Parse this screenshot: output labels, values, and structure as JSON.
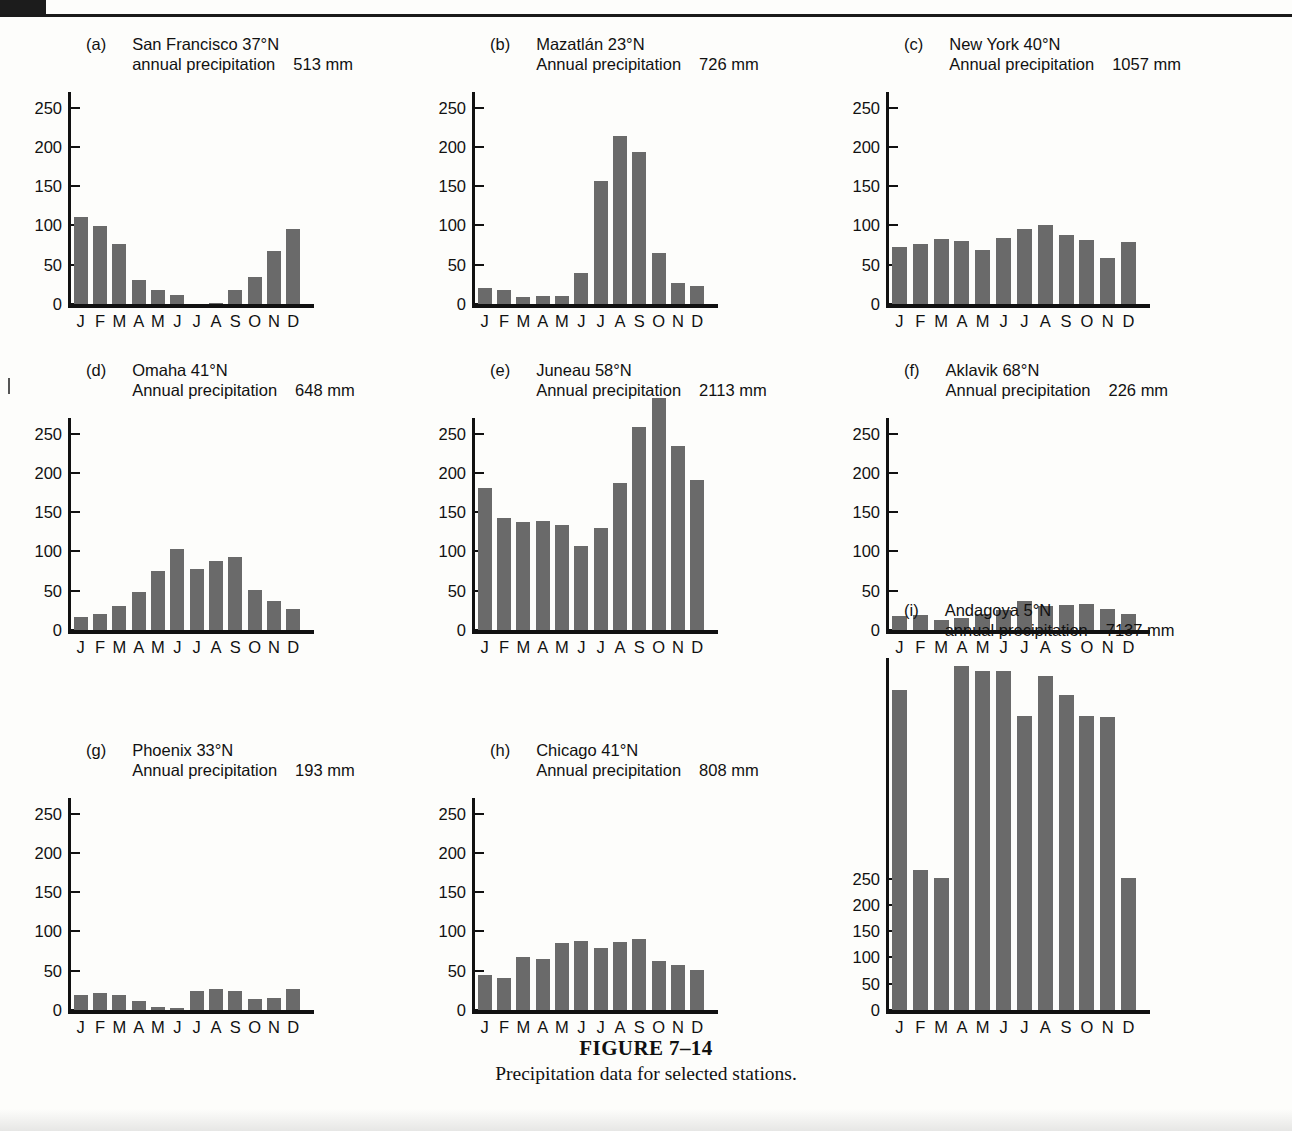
{
  "figure": {
    "caption_title": "FIGURE 7–14",
    "caption_subtitle": "Precipitation data for selected stations.",
    "months": [
      "J",
      "F",
      "M",
      "A",
      "M",
      "J",
      "J",
      "A",
      "S",
      "O",
      "N",
      "D"
    ],
    "y_ticks": [
      0,
      50,
      100,
      150,
      200,
      250
    ],
    "units": "mm",
    "bar_color": "#6a6a6a",
    "axis_color": "#111111"
  },
  "chart_data": [
    {
      "type": "bar",
      "panel": "a",
      "station": "San Francisco 37°N",
      "precip_label": "annual precipitation",
      "precip_value": "513 mm",
      "annual_total": 513,
      "title": "San Francisco 37°N annual precipitation 513 mm",
      "xlabel": "",
      "ylabel": "",
      "grid": false,
      "ylim": [
        0,
        270
      ],
      "yticks": [
        0,
        50,
        100,
        150,
        200,
        250
      ],
      "categories": [
        "J",
        "F",
        "M",
        "A",
        "M",
        "J",
        "J",
        "A",
        "S",
        "O",
        "N",
        "D"
      ],
      "values": [
        111,
        99,
        77,
        30,
        18,
        11,
        0,
        1,
        18,
        35,
        68,
        96
      ]
    },
    {
      "type": "bar",
      "panel": "b",
      "station": "Mazatlán 23°N",
      "precip_label": "Annual precipitation",
      "precip_value": "726 mm",
      "annual_total": 726,
      "title": "Mazatlán 23°N Annual precipitation 726 mm",
      "xlabel": "",
      "ylabel": "",
      "grid": false,
      "ylim": [
        0,
        270
      ],
      "yticks": [
        0,
        50,
        100,
        150,
        200,
        250
      ],
      "categories": [
        "J",
        "F",
        "M",
        "A",
        "M",
        "J",
        "J",
        "A",
        "S",
        "O",
        "N",
        "D"
      ],
      "values": [
        21,
        18,
        9,
        10,
        10,
        39,
        157,
        214,
        194,
        65,
        27,
        23
      ]
    },
    {
      "type": "bar",
      "panel": "c",
      "station": "New York 40°N",
      "precip_label": "Annual precipitation",
      "precip_value": "1057 mm",
      "annual_total": 1057,
      "title": "New York 40°N Annual precipitation 1057 mm",
      "xlabel": "",
      "ylabel": "",
      "grid": false,
      "ylim": [
        0,
        270
      ],
      "yticks": [
        0,
        50,
        100,
        150,
        200,
        250
      ],
      "categories": [
        "J",
        "F",
        "M",
        "A",
        "M",
        "J",
        "J",
        "A",
        "S",
        "O",
        "N",
        "D"
      ],
      "values": [
        72,
        77,
        83,
        80,
        69,
        84,
        96,
        100,
        88,
        81,
        58,
        79
      ]
    },
    {
      "type": "bar",
      "panel": "d",
      "station": "Omaha 41°N",
      "precip_label": "Annual precipitation",
      "precip_value": "648 mm",
      "annual_total": 648,
      "title": "Omaha 41°N Annual precipitation 648 mm",
      "xlabel": "",
      "ylabel": "",
      "grid": false,
      "ylim": [
        0,
        270
      ],
      "yticks": [
        0,
        50,
        100,
        150,
        200,
        250
      ],
      "categories": [
        "J",
        "F",
        "M",
        "A",
        "M",
        "J",
        "J",
        "A",
        "S",
        "O",
        "N",
        "D"
      ],
      "values": [
        17,
        21,
        30,
        48,
        75,
        103,
        78,
        88,
        93,
        51,
        37,
        27
      ]
    },
    {
      "type": "bar",
      "panel": "e",
      "station": "Juneau 58°N",
      "precip_label": "Annual precipitation",
      "precip_value": "2113 mm",
      "annual_total": 2113,
      "title": "Juneau 58°N Annual precipitation 2113 mm",
      "xlabel": "",
      "ylabel": "",
      "grid": false,
      "ylim": [
        0,
        270
      ],
      "yticks": [
        0,
        50,
        100,
        150,
        200,
        250
      ],
      "categories": [
        "J",
        "F",
        "M",
        "A",
        "M",
        "J",
        "J",
        "A",
        "S",
        "O",
        "N",
        "D"
      ],
      "values": [
        181,
        143,
        138,
        139,
        134,
        107,
        130,
        187,
        258,
        295,
        234,
        191
      ]
    },
    {
      "type": "bar",
      "panel": "f",
      "station": "Aklavik 68°N",
      "precip_label": "Annual precipitation",
      "precip_value": "226 mm",
      "annual_total": 226,
      "title": "Aklavik 68°N Annual precipitation 226 mm",
      "xlabel": "",
      "ylabel": "",
      "grid": false,
      "ylim": [
        0,
        270
      ],
      "yticks": [
        0,
        50,
        100,
        150,
        200,
        250
      ],
      "categories": [
        "J",
        "F",
        "M",
        "A",
        "M",
        "J",
        "J",
        "A",
        "S",
        "O",
        "N",
        "D"
      ],
      "values": [
        18,
        19,
        13,
        15,
        20,
        25,
        37,
        31,
        32,
        33,
        27,
        21
      ]
    },
    {
      "type": "bar",
      "panel": "g",
      "station": "Phoenix 33°N",
      "precip_label": "Annual precipitation",
      "precip_value": "193 mm",
      "annual_total": 193,
      "title": "Phoenix 33°N Annual precipitation 193 mm",
      "xlabel": "",
      "ylabel": "",
      "grid": false,
      "ylim": [
        0,
        270
      ],
      "yticks": [
        0,
        50,
        100,
        150,
        200,
        250
      ],
      "categories": [
        "J",
        "F",
        "M",
        "A",
        "M",
        "J",
        "J",
        "A",
        "S",
        "O",
        "N",
        "D"
      ],
      "values": [
        19,
        22,
        19,
        12,
        4,
        3,
        24,
        27,
        24,
        14,
        15,
        27
      ]
    },
    {
      "type": "bar",
      "panel": "h",
      "station": "Chicago 41°N",
      "precip_label": "Annual precipitation",
      "precip_value": "808 mm",
      "annual_total": 808,
      "title": "Chicago 41°N Annual precipitation 808 mm",
      "xlabel": "",
      "ylabel": "",
      "grid": false,
      "ylim": [
        0,
        270
      ],
      "yticks": [
        0,
        50,
        100,
        150,
        200,
        250
      ],
      "categories": [
        "J",
        "F",
        "M",
        "A",
        "M",
        "J",
        "J",
        "A",
        "S",
        "O",
        "N",
        "D"
      ],
      "values": [
        45,
        41,
        68,
        65,
        85,
        88,
        79,
        86,
        91,
        63,
        57,
        51
      ]
    },
    {
      "type": "bar",
      "panel": "i",
      "station": "Andagoya 5°N",
      "precip_label": "annual precipitation",
      "precip_value": "7137 mm",
      "annual_total": 7137,
      "title": "Andagoya 5°N annual precipitation 7137 mm",
      "xlabel": "",
      "ylabel": "",
      "grid": false,
      "note": "bars exceed the plotted axis range; axis labelled to 250 with ticks every 50",
      "ylim": [
        0,
        670
      ],
      "yticks": [
        0,
        50,
        100,
        150,
        200,
        250
      ],
      "categories": [
        "J",
        "F",
        "M",
        "A",
        "M",
        "J",
        "J",
        "A",
        "S",
        "O",
        "N",
        "D"
      ],
      "values": [
        610,
        267,
        251,
        655,
        645,
        645,
        560,
        635,
        600,
        560,
        557,
        252
      ]
    }
  ]
}
